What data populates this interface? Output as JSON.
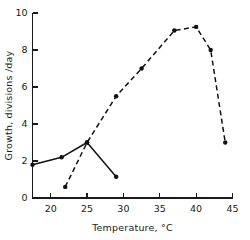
{
  "chart_data": {
    "type": "line",
    "title": "",
    "xlabel": "Temperature, °C",
    "ylabel": "Growth, divisions /day",
    "xlim": [
      17.5,
      45
    ],
    "ylim": [
      0,
      10
    ],
    "xticks": [
      20,
      25,
      30,
      35,
      40,
      45
    ],
    "yticks": [
      0,
      2,
      4,
      6,
      8,
      10
    ],
    "xtick_labels": [
      "20",
      "25",
      "30",
      "35",
      "40",
      "45"
    ],
    "ytick_labels": [
      "0",
      "2",
      "4",
      "6",
      "8",
      "10"
    ],
    "grid": false,
    "legend": "none",
    "series": [
      {
        "name": "solid-series",
        "style": "solid",
        "marker": "filled-circle",
        "color": "#111111",
        "x": [
          17.5,
          21.5,
          25.0,
          29.0
        ],
        "y": [
          1.8,
          2.2,
          3.0,
          1.15
        ]
      },
      {
        "name": "dashed-series",
        "style": "dashed",
        "marker": "filled-circle",
        "color": "#111111",
        "x": [
          22.0,
          25.0,
          29.0,
          32.5,
          37.0,
          40.0,
          42.0,
          44.0
        ],
        "y": [
          0.6,
          3.0,
          5.5,
          7.0,
          9.05,
          9.25,
          8.0,
          3.0
        ]
      }
    ]
  },
  "axes": {
    "x_title": "Temperature, °C",
    "y_title": "Growth, divisions /day"
  }
}
